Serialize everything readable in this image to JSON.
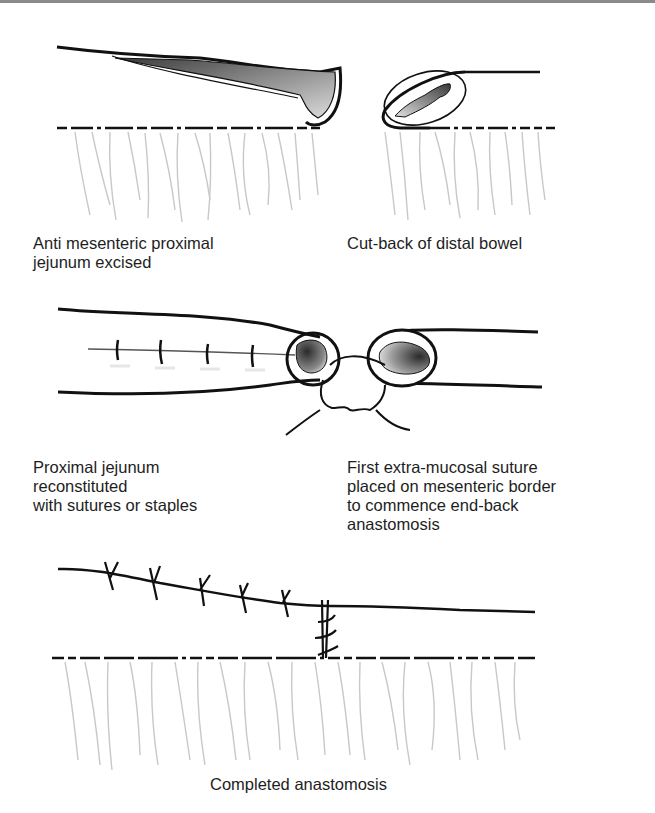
{
  "figure": {
    "panels": [
      {
        "id": "step1-left",
        "caption": "Anti mesenteric proximal\njejunum excised"
      },
      {
        "id": "step1-right",
        "caption": "Cut-back of distal bowel"
      },
      {
        "id": "step2-left",
        "caption": "Proximal jejunum\nreconstituted\nwith sutures or staples"
      },
      {
        "id": "step2-right",
        "caption": "First extra-mucosal suture\nplaced on mesenteric border\nto commence end-back\nanastomosis"
      },
      {
        "id": "step3",
        "caption": "Completed anastomosis"
      }
    ],
    "colors": {
      "line": "#111111",
      "mesentery": "#c8c8c8",
      "lumen_dark": "#3a3a3a",
      "lumen_light": "#f0f0f0",
      "frame": "#8a8a8a"
    }
  }
}
